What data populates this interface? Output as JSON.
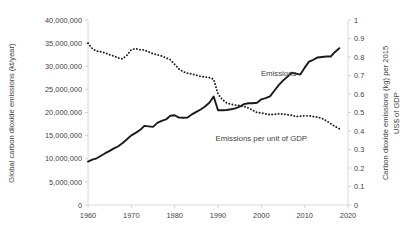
{
  "chart_data": {
    "type": "line",
    "title": "",
    "xlabel": "",
    "ylabel": "Global carbon dioxide emissions (kt/year)",
    "y2label_line1": "Carbon dioxide emissions (kg) per 2015",
    "y2label_line2": "US$ of GDP",
    "grid": false,
    "legend_position": "inline-annotation",
    "xlim": [
      1960,
      2020
    ],
    "ylim": [
      0,
      40000000
    ],
    "y2lim": [
      0,
      1
    ],
    "xticks": [
      1960,
      1970,
      1980,
      1990,
      2000,
      2010,
      2020
    ],
    "xtick_labels": [
      "1960",
      "1970",
      "1980",
      "1990",
      "2000",
      "2010",
      "2020"
    ],
    "yticks": [
      0,
      5000000,
      10000000,
      15000000,
      20000000,
      25000000,
      30000000,
      35000000,
      40000000
    ],
    "ytick_labels": [
      "0",
      "5,000,000",
      "10,000,000",
      "15,000,000",
      "20,000,000",
      "25,000,000",
      "30,000,000",
      "35,000,000",
      "40,000,000"
    ],
    "y2ticks": [
      0,
      0.1,
      0.2,
      0.3,
      0.4,
      0.5,
      0.6,
      0.7,
      0.8,
      0.9,
      1
    ],
    "y2tick_labels": [
      "0",
      "0.1",
      "0.2",
      "0.3",
      "0.4",
      "0.5",
      "0.6",
      "0.7",
      "0.8",
      "0.9",
      "1"
    ],
    "x": [
      1960,
      1961,
      1962,
      1963,
      1964,
      1965,
      1966,
      1967,
      1968,
      1969,
      1970,
      1971,
      1972,
      1973,
      1974,
      1975,
      1976,
      1977,
      1978,
      1979,
      1980,
      1981,
      1982,
      1983,
      1984,
      1985,
      1986,
      1987,
      1988,
      1989,
      1990,
      1991,
      1992,
      1993,
      1994,
      1995,
      1996,
      1997,
      1998,
      1999,
      2000,
      2001,
      2002,
      2003,
      2004,
      2005,
      2006,
      2007,
      2008,
      2009,
      2010,
      2011,
      2012,
      2013,
      2014,
      2015,
      2016,
      2017,
      2018
    ],
    "series": [
      {
        "name": "Emissions",
        "axis": "left",
        "style": "solid",
        "label_x": 2004,
        "label_y": 27800000,
        "values": [
          9396000,
          9800000,
          10100000,
          10650000,
          11200000,
          11700000,
          12250000,
          12700000,
          13400000,
          14200000,
          15050000,
          15600000,
          16200000,
          17100000,
          17000000,
          16900000,
          17750000,
          18200000,
          18500000,
          19300000,
          19400000,
          18900000,
          18850000,
          18900000,
          19600000,
          20150000,
          20650000,
          21300000,
          22100000,
          23450000,
          20500000,
          20500000,
          20550000,
          20700000,
          20900000,
          21250000,
          21800000,
          22000000,
          22000000,
          22100000,
          22850000,
          23100000,
          23500000,
          24700000,
          25900000,
          26900000,
          27700000,
          28600000,
          28400000,
          28200000,
          29700000,
          31000000,
          31400000,
          31900000,
          32000000,
          32100000,
          32100000,
          33100000,
          33900000
        ]
      },
      {
        "name": "Emissions per unit of GDP",
        "axis": "right",
        "style": "dotted",
        "label_x": 2000,
        "label_y": 0.345,
        "values": [
          0.875,
          0.845,
          0.832,
          0.828,
          0.822,
          0.812,
          0.805,
          0.795,
          0.79,
          0.81,
          0.84,
          0.845,
          0.84,
          0.838,
          0.828,
          0.818,
          0.812,
          0.805,
          0.795,
          0.785,
          0.76,
          0.735,
          0.72,
          0.712,
          0.708,
          0.702,
          0.695,
          0.692,
          0.688,
          0.68,
          0.6,
          0.57,
          0.552,
          0.545,
          0.54,
          0.538,
          0.533,
          0.525,
          0.512,
          0.5,
          0.498,
          0.492,
          0.488,
          0.49,
          0.493,
          0.492,
          0.488,
          0.485,
          0.478,
          0.48,
          0.482,
          0.482,
          0.478,
          0.475,
          0.468,
          0.455,
          0.44,
          0.425,
          0.412
        ]
      }
    ]
  }
}
